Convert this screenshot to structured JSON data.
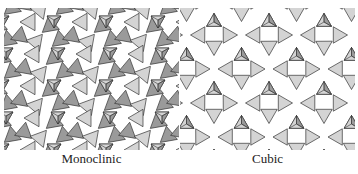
{
  "figure": {
    "panels": [
      {
        "id": "monoclinic",
        "label": "Monoclinic"
      },
      {
        "id": "cubic",
        "label": "Cubic"
      }
    ]
  },
  "colors": {
    "light_face": "#d4d4d4",
    "dark_face": "#9a9a9a",
    "edge": "#333333",
    "background": "#ffffff"
  }
}
